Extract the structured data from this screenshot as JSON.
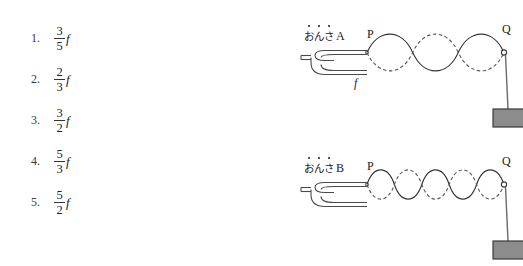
{
  "options": {
    "items": [
      {
        "number": "1.",
        "numerator": "3",
        "denominator": "5",
        "variable": "f"
      },
      {
        "number": "2.",
        "numerator": "2",
        "denominator": "3",
        "variable": "f"
      },
      {
        "number": "3.",
        "numerator": "3",
        "denominator": "2",
        "variable": "f"
      },
      {
        "number": "4.",
        "numerator": "5",
        "denominator": "3",
        "variable": "f"
      },
      {
        "number": "5.",
        "numerator": "5",
        "denominator": "2",
        "variable": "f"
      }
    ]
  },
  "figures": [
    {
      "id": "figure-a",
      "fork_kana": "おんさ",
      "fork_name": "A",
      "point_left": "P",
      "point_right": "Q",
      "frequency_label": "f",
      "loops": 3,
      "wave_solid_color": "#333333",
      "wave_dashed_color": "#555555",
      "weight_fill": "#8c8c8c",
      "weight_stroke": "#3a3a3a"
    },
    {
      "id": "figure-b",
      "fork_kana": "おんさ",
      "fork_name": "B",
      "point_left": "P",
      "point_right": "Q",
      "frequency_label": "",
      "loops": 5,
      "wave_solid_color": "#333333",
      "wave_dashed_color": "#555555",
      "weight_fill": "#8c8c8c",
      "weight_stroke": "#3a3a3a"
    }
  ],
  "colors": {
    "background": "#ffffff",
    "ink": "#1a1a1a",
    "line": "#444444"
  }
}
